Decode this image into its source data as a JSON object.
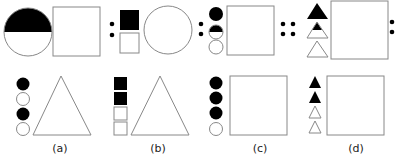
{
  "figure": {
    "type": "analogy-puzzle",
    "question_row": {
      "description": "A : B :: C : D :: E : ?",
      "separators": [
        {
          "kind": "ratio",
          "symbol": ":"
        },
        {
          "kind": "proportion",
          "symbol": "::"
        },
        {
          "kind": "ratio",
          "symbol": ":"
        }
      ]
    },
    "options": [
      {
        "label": "(a)",
        "markers": [
          "black-circle",
          "white-circle",
          "black-circle",
          "white-circle"
        ],
        "main_shape": "triangle"
      },
      {
        "label": "(b)",
        "markers": [
          "black-square",
          "black-square",
          "white-square",
          "white-square"
        ],
        "main_shape": "triangle"
      },
      {
        "label": "(c)",
        "markers": [
          "black-circle",
          "black-circle",
          "black-circle",
          "white-circle"
        ],
        "main_shape": "square"
      },
      {
        "label": "(d)",
        "markers": [
          "black-triangle",
          "black-triangle",
          "white-triangle",
          "white-triangle"
        ],
        "main_shape": "square"
      }
    ],
    "colors": {
      "stroke": "#888888",
      "fill_black": "#000000",
      "fill_white": "#ffffff"
    }
  }
}
